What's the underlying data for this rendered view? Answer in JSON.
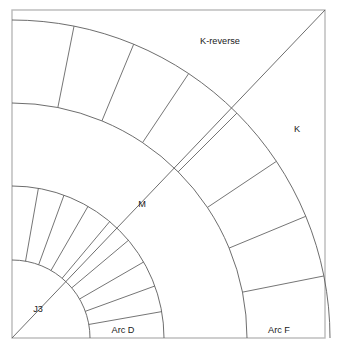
{
  "figure": {
    "type": "technical-arc-diagram",
    "background_color": "#ffffff",
    "line_color": "#5c5c5c",
    "frame_color": "#b9b9b9",
    "text_color": "#1a1a1a",
    "frame": {
      "x": 12,
      "y": 10,
      "width": 313,
      "height": 328
    }
  },
  "geometry": {
    "center": {
      "x": 12,
      "y": 338
    },
    "angle_start_deg": 0,
    "angle_end_deg": 90,
    "diagonal": {
      "from": {
        "x": 12,
        "y": 338
      },
      "to": {
        "x": 325,
        "y": 10
      },
      "angle_deg": 45
    },
    "bands": [
      {
        "name": "Arc D",
        "inner_radius": 78,
        "outer_radius": 152,
        "segment_count": 9,
        "divider_angles_deg": [
          10,
          20,
          30,
          40,
          50,
          60,
          70,
          80
        ]
      },
      {
        "name": "M",
        "inner_radius": 152,
        "outer_radius": 235,
        "segment_count": 1,
        "divider_angles_deg": []
      },
      {
        "name": "Arc F",
        "inner_radius": 235,
        "outer_radius": 318,
        "segment_count": 8,
        "divider_angles_deg": [
          11.25,
          22.5,
          33.75,
          45,
          56.25,
          67.5,
          78.75
        ]
      }
    ]
  },
  "labels": [
    {
      "id": "k-reverse",
      "text": "K-reverse",
      "x": 220,
      "y": 42
    },
    {
      "id": "k",
      "text": "K",
      "x": 297,
      "y": 130
    },
    {
      "id": "m",
      "text": "M",
      "x": 142,
      "y": 205
    },
    {
      "id": "j3",
      "text": "J3",
      "x": 38,
      "y": 310
    },
    {
      "id": "arc-d",
      "text": "Arc D",
      "x": 123,
      "y": 331
    },
    {
      "id": "arc-f",
      "text": "Arc F",
      "x": 279,
      "y": 331
    }
  ]
}
